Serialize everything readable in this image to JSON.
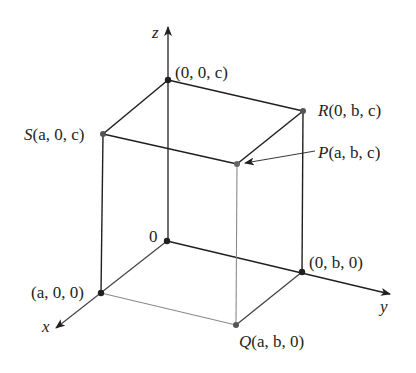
{
  "diagram": {
    "type": "3d-coordinate-box",
    "axes": {
      "x": {
        "label": "x"
      },
      "y": {
        "label": "y"
      },
      "z": {
        "label": "z"
      }
    },
    "points": {
      "origin": {
        "name": "",
        "coords": "0"
      },
      "z_point": {
        "name": "",
        "coords": "(0, 0, c)"
      },
      "S": {
        "name": "S",
        "coords": "(a, 0, c)"
      },
      "R": {
        "name": "R",
        "coords": "(0, b, c)"
      },
      "P": {
        "name": "P",
        "coords": "(a, b, c)"
      },
      "x_point": {
        "name": "",
        "coords": "(a, 0, 0)"
      },
      "y_point": {
        "name": "",
        "coords": "(0, b, 0)"
      },
      "Q": {
        "name": "Q",
        "coords": "(a, b, 0)"
      }
    },
    "colors": {
      "line": "#231f20",
      "hidden_line": "#8a8a8a",
      "text": "#231f20"
    }
  }
}
